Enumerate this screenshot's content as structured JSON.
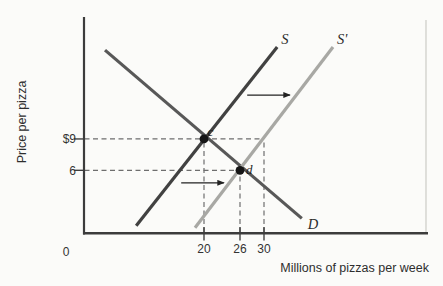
{
  "chart_data": {
    "type": "line",
    "title": "",
    "xlabel": "Millions of pizzas per week",
    "ylabel": "Price per pizza",
    "origin_label": "0",
    "xlim": [
      0,
      57
    ],
    "ylim": [
      0,
      20.8
    ],
    "grid": false,
    "x_ticks": [
      20,
      26,
      30
    ],
    "y_tick_labels": [
      "$9",
      "6"
    ],
    "y_tick_values": [
      9,
      6
    ],
    "series": [
      {
        "name": "demand",
        "label": "D",
        "color": "#585858",
        "points": [
          [
            3.5,
            17.5
          ],
          [
            36.3,
            1.4
          ]
        ]
      },
      {
        "name": "supply",
        "label": "S",
        "color": "#414141",
        "points": [
          [
            8.7,
            0.7
          ],
          [
            32.2,
            17.8
          ]
        ]
      },
      {
        "name": "supply-shifted",
        "label": "S'",
        "color": "#a8a8a4",
        "points": [
          [
            18.5,
            0.5
          ],
          [
            41.5,
            17.8
          ]
        ]
      }
    ],
    "points": [
      {
        "label": "c",
        "x": 20,
        "y": 9
      },
      {
        "label": "d",
        "x": 26,
        "y": 6
      }
    ],
    "guides": {
      "dashed_h": [
        {
          "y": 9,
          "x_to": 30
        },
        {
          "y": 6,
          "x_to": 26
        }
      ],
      "dashed_v": [
        {
          "x": 20,
          "y_to": 9
        },
        {
          "x": 26,
          "y_to": 6
        },
        {
          "x": 30,
          "y_to": 9
        }
      ]
    },
    "shift_arrows": [
      {
        "from_x": 27.2,
        "to_x": 34.3,
        "y": 13.2
      },
      {
        "from_x": 16.2,
        "to_x": 23.3,
        "y": 4.8
      }
    ],
    "colors": {
      "axis": "#3c3c3c",
      "dashed": "#6e6e6e",
      "tick": "#333333",
      "dot": "#161616",
      "arrow": "#222222",
      "right_border": "#d8d8d3",
      "background": "#fbfbf9"
    }
  }
}
